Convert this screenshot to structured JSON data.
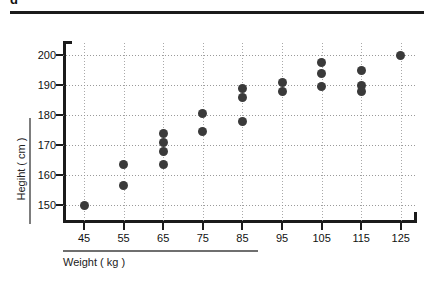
{
  "header": {
    "clipped_title": "g",
    "rule_color": "#1b1b1b"
  },
  "axis_titles": {
    "y": "Hegiht ( cm )",
    "x": "Weight ( kg )"
  },
  "colors": {
    "marker": "#3a3a3a",
    "axis": "#1b1b1b",
    "grid": "#9a9a9a",
    "background": "#ffffff"
  },
  "ticks": {
    "y": [
      "200",
      "190",
      "180",
      "170",
      "160",
      "150"
    ],
    "x": [
      "45",
      "55",
      "65",
      "75",
      "85",
      "95",
      "105",
      "115",
      "125"
    ]
  },
  "chart_data": {
    "type": "scatter",
    "title": "",
    "xlabel": "Weight ( kg )",
    "ylabel": "Hegiht ( cm )",
    "xlim": [
      40,
      130
    ],
    "ylim": [
      145,
      205
    ],
    "xticks": [
      45,
      55,
      65,
      75,
      85,
      95,
      105,
      115,
      125
    ],
    "yticks": [
      150,
      160,
      170,
      180,
      190,
      200
    ],
    "grid": true,
    "grid_style": "dotted",
    "legend": null,
    "marker": "filled-circle",
    "n_points": 21,
    "points": [
      {
        "x": 45,
        "y": 150.0
      },
      {
        "x": 55,
        "y": 163.5
      },
      {
        "x": 55,
        "y": 156.5
      },
      {
        "x": 65,
        "y": 174.0
      },
      {
        "x": 65,
        "y": 171.0
      },
      {
        "x": 65,
        "y": 168.0
      },
      {
        "x": 65,
        "y": 163.5
      },
      {
        "x": 75,
        "y": 180.5
      },
      {
        "x": 75,
        "y": 174.5
      },
      {
        "x": 85,
        "y": 189.0
      },
      {
        "x": 85,
        "y": 186.0
      },
      {
        "x": 85,
        "y": 178.0
      },
      {
        "x": 95,
        "y": 191.0
      },
      {
        "x": 95,
        "y": 188.0
      },
      {
        "x": 105,
        "y": 197.5
      },
      {
        "x": 105,
        "y": 194.0
      },
      {
        "x": 105,
        "y": 189.5
      },
      {
        "x": 115,
        "y": 195.0
      },
      {
        "x": 115,
        "y": 190.0
      },
      {
        "x": 115,
        "y": 188.0
      },
      {
        "x": 125,
        "y": 200.0
      }
    ]
  }
}
